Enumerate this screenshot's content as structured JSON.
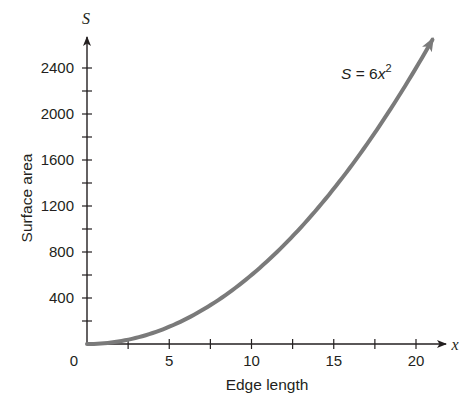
{
  "chart_data": {
    "type": "line",
    "title": "",
    "xlabel": "Edge length",
    "ylabel": "Surface area",
    "x_axis_variable": "x",
    "y_axis_variable": "S",
    "xlim": [
      0,
      21
    ],
    "ylim": [
      0,
      2640
    ],
    "x_ticks": [
      0,
      2.5,
      5,
      7.5,
      10,
      12.5,
      15,
      17.5,
      20
    ],
    "x_tick_labels": [
      "0",
      "5",
      "10",
      "15",
      "20"
    ],
    "x_labeled_ticks": [
      0,
      5,
      10,
      15,
      20
    ],
    "y_ticks": [
      0,
      200,
      400,
      600,
      800,
      1000,
      1200,
      1400,
      1600,
      1800,
      2000,
      2200,
      2400
    ],
    "y_tick_labels": [
      "400",
      "800",
      "1200",
      "1600",
      "2000",
      "2400"
    ],
    "y_labeled_ticks": [
      400,
      800,
      1200,
      1600,
      2000,
      2400
    ],
    "grid": false,
    "legend": null,
    "series": [
      {
        "name": "S = 6x^2",
        "equation": "S = 6x^2",
        "color": "#7a7a7a",
        "x": [
          0,
          2.5,
          5,
          7.5,
          10,
          12.5,
          15,
          17.5,
          20,
          21
        ],
        "values": [
          0,
          37.5,
          150,
          337.5,
          600,
          937.5,
          1350,
          1837.5,
          2400,
          2646
        ]
      }
    ],
    "annotations": [
      {
        "text": "S = 6x²",
        "position": "upper right near curve end"
      }
    ]
  },
  "labels": {
    "y_var": "S",
    "x_var": "x",
    "origin": "0",
    "y_title": "Surface area",
    "x_title": "Edge length",
    "equation_s": "S",
    "equation_eq": " = 6",
    "equation_x": "x",
    "equation_exp": "2"
  },
  "colors": {
    "axis": "#231f20",
    "curve": "#7a7a7a",
    "text": "#231f20",
    "background": "#ffffff"
  }
}
